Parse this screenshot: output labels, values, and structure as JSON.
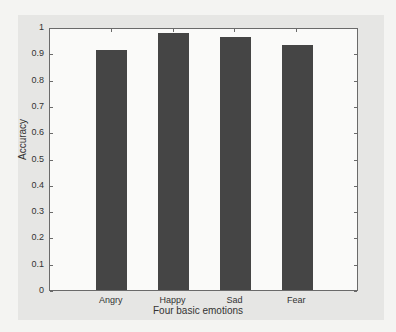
{
  "chart_data": {
    "type": "bar",
    "title": "",
    "xlabel": "Four basic emotions",
    "ylabel": "Accuracy",
    "categories": [
      "Angry",
      "Happy",
      "Sad",
      "Fear"
    ],
    "values": [
      0.92,
      0.985,
      0.97,
      0.94
    ],
    "ylim": [
      0,
      1
    ],
    "yticks": [
      "0",
      "0.1",
      "0.2",
      "0.3",
      "0.4",
      "0.5",
      "0.6",
      "0.7",
      "0.8",
      "0.9",
      "1"
    ],
    "grid": false,
    "legend": null,
    "bar_color": "#454545"
  }
}
